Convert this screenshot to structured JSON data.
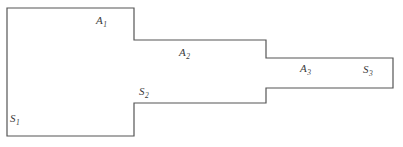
{
  "figure": {
    "background_color": "#ffffff",
    "stroke_color": "#555555",
    "stroke_width": 1.2,
    "width": 403,
    "height": 147,
    "outline_path": "M 7 8 L 134 8 L 134 40 L 266 40 L 266 58 L 393 58 L 393 88 L 266 88 L 266 103 L 134 103 L 134 136 L 7 136 Z",
    "vertices": [
      [
        7,
        8
      ],
      [
        134,
        8
      ],
      [
        134,
        40
      ],
      [
        266,
        40
      ],
      [
        266,
        58
      ],
      [
        393,
        58
      ],
      [
        393,
        88
      ],
      [
        266,
        88
      ],
      [
        266,
        103
      ],
      [
        134,
        103
      ],
      [
        134,
        136
      ],
      [
        7,
        136
      ]
    ]
  },
  "labels": [
    {
      "id": "label-A1",
      "name": "area-label-A1",
      "base": "A",
      "subscript": "1",
      "text": "A1",
      "x": 96,
      "y": 15,
      "color": "#3a3a3a"
    },
    {
      "id": "label-A2",
      "name": "area-label-A2",
      "base": "A",
      "subscript": "2",
      "text": "A2",
      "x": 179,
      "y": 47,
      "color": "#3a3a3a"
    },
    {
      "id": "label-A3",
      "name": "area-label-A3",
      "base": "A",
      "subscript": "3",
      "text": "A3",
      "x": 300,
      "y": 63,
      "color": "#3a3a3a"
    },
    {
      "id": "label-S1",
      "name": "area-label-S1",
      "base": "S",
      "subscript": "1",
      "text": "S1",
      "x": 10,
      "y": 113,
      "color": "#3a3a3a"
    },
    {
      "id": "label-S2",
      "name": "area-label-S2",
      "base": "S",
      "subscript": "2",
      "text": "S2",
      "x": 139,
      "y": 86,
      "color": "#3a3a3a"
    },
    {
      "id": "label-S3",
      "name": "area-label-S3",
      "base": "S",
      "subscript": "3",
      "text": "S3",
      "x": 363,
      "y": 64,
      "color": "#3a3a3a"
    }
  ]
}
